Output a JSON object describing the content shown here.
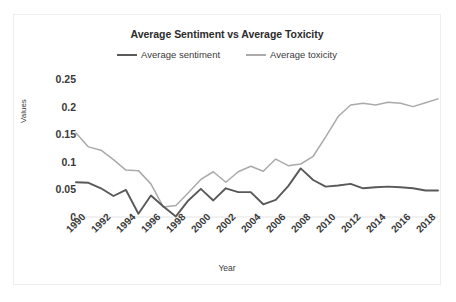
{
  "chart_data": {
    "type": "line",
    "title": "Average Sentiment vs Average Toxicity",
    "xlabel": "Year",
    "ylabel": "Values",
    "ylim": [
      0,
      0.25
    ],
    "xlim": [
      1990,
      2019
    ],
    "grid": false,
    "legend_position": "top-center",
    "y_ticks": [
      "0",
      "0.05",
      "0.1",
      "0.15",
      "0.2",
      "0.25"
    ],
    "y_tick_values": [
      0,
      0.05,
      0.1,
      0.15,
      0.2,
      0.25
    ],
    "x_ticks": [
      "1990",
      "1992",
      "1994",
      "1996",
      "1998",
      "2000",
      "2002",
      "2004",
      "2006",
      "2008",
      "2010",
      "2012",
      "2014",
      "2016",
      "2018"
    ],
    "x_tick_values": [
      1990,
      1992,
      1994,
      1996,
      1998,
      2000,
      2002,
      2004,
      2006,
      2008,
      2010,
      2012,
      2014,
      2016,
      2018
    ],
    "x": [
      1990,
      1991,
      1992,
      1993,
      1994,
      1995,
      1996,
      1997,
      1998,
      1999,
      2000,
      2001,
      2002,
      2003,
      2004,
      2005,
      2006,
      2007,
      2008,
      2009,
      2010,
      2011,
      2012,
      2013,
      2014,
      2015,
      2016,
      2017,
      2018,
      2019
    ],
    "series": [
      {
        "name": "Average sentiment",
        "color": "#595959",
        "values": [
          0.063,
          0.062,
          0.052,
          0.038,
          0.049,
          0.006,
          0.039,
          0.019,
          0.001,
          0.03,
          0.051,
          0.03,
          0.052,
          0.045,
          0.045,
          0.023,
          0.031,
          0.056,
          0.088,
          0.067,
          0.055,
          0.057,
          0.06,
          0.052,
          0.054,
          0.055,
          0.054,
          0.052,
          0.048,
          0.048
        ]
      },
      {
        "name": "Average toxicity",
        "color": "#aaaaaa",
        "values": [
          0.152,
          0.127,
          0.121,
          0.104,
          0.085,
          0.084,
          0.06,
          0.018,
          0.021,
          0.044,
          0.068,
          0.082,
          0.063,
          0.082,
          0.092,
          0.083,
          0.105,
          0.093,
          0.096,
          0.11,
          0.145,
          0.182,
          0.203,
          0.206,
          0.203,
          0.208,
          0.206,
          0.2,
          0.207,
          0.214
        ]
      }
    ]
  },
  "legend": {
    "items": [
      {
        "label": "Average sentiment",
        "color": "#595959"
      },
      {
        "label": "Average toxicity",
        "color": "#aaaaaa"
      }
    ]
  }
}
